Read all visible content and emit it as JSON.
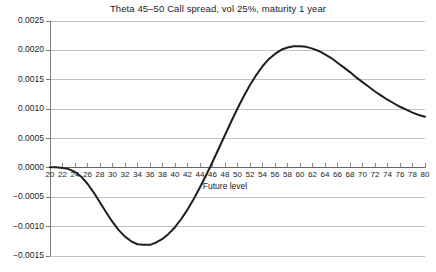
{
  "chart_data": {
    "type": "line",
    "title": "Theta 45–50 Call spread, vol 25%, maturity 1 year",
    "xlabel": "Future level",
    "ylabel": "",
    "xlim": [
      20,
      80
    ],
    "ylim": [
      -0.0015,
      0.0025
    ],
    "grid": true,
    "legend": null,
    "xticks": [
      20,
      22,
      24,
      26,
      28,
      30,
      32,
      34,
      36,
      38,
      40,
      42,
      44,
      46,
      48,
      50,
      52,
      54,
      56,
      58,
      60,
      62,
      64,
      66,
      68,
      70,
      72,
      74,
      76,
      78,
      80
    ],
    "xtick_labels": [
      "20",
      "22",
      "24",
      "26",
      "28",
      "30",
      "32",
      "34",
      "36",
      "38",
      "40",
      "42",
      "44",
      "46",
      "48",
      "50",
      "52",
      "54",
      "56",
      "58",
      "60",
      "62",
      "64",
      "66",
      "68",
      "70",
      "72",
      "74",
      "76",
      "78",
      "80"
    ],
    "yticks": [
      0.0025,
      0.002,
      0.0015,
      0.001,
      0.0005,
      0.0,
      -0.0005,
      -0.001,
      -0.0015
    ],
    "ytick_labels": [
      "0.0025",
      "0.0020",
      "0.0015",
      "0.0010",
      "0.0005",
      "0.0000",
      "−0.0005",
      "−0.0010",
      "−0.0015"
    ],
    "series": [
      {
        "name": "Theta 45-50 call spread",
        "color": "#1f1f1f",
        "line_width": 2,
        "x": [
          20,
          21,
          22,
          23,
          24,
          25,
          26,
          27,
          28,
          29,
          30,
          31,
          32,
          33,
          34,
          35,
          36,
          37,
          38,
          39,
          40,
          41,
          42,
          43,
          44,
          45,
          46,
          47,
          48,
          49,
          50,
          51,
          52,
          53,
          54,
          55,
          56,
          57,
          58,
          59,
          60,
          61,
          62,
          63,
          64,
          65,
          66,
          67,
          68,
          69,
          70,
          71,
          72,
          73,
          74,
          75,
          76,
          77,
          78,
          79,
          80
        ],
        "y": [
          1e-05,
          1e-05,
          0.0,
          -2e-05,
          -7e-05,
          -0.00015,
          -0.00027,
          -0.00042,
          -0.00059,
          -0.00076,
          -0.00092,
          -0.00106,
          -0.00117,
          -0.00125,
          -0.0013,
          -0.00131,
          -0.00131,
          -0.00127,
          -0.00121,
          -0.00112,
          -0.00101,
          -0.00087,
          -0.00071,
          -0.00053,
          -0.00033,
          -0.00012,
          0.0001,
          0.00033,
          0.00056,
          0.00079,
          0.00101,
          0.00122,
          0.00141,
          0.00158,
          0.00173,
          0.00185,
          0.00194,
          0.00201,
          0.00205,
          0.00207,
          0.00207,
          0.00206,
          0.00203,
          0.00199,
          0.00193,
          0.00187,
          0.00179,
          0.00171,
          0.00163,
          0.00154,
          0.00146,
          0.00138,
          0.0013,
          0.00123,
          0.00116,
          0.0011,
          0.00104,
          0.00099,
          0.00094,
          0.0009,
          0.00087
        ]
      }
    ],
    "colors": {
      "axis": "#6e6e6e",
      "grid": "#a8a8a8",
      "line": "#1f1f1f",
      "text": "#1c1c1c",
      "background": "#ffffff"
    }
  }
}
